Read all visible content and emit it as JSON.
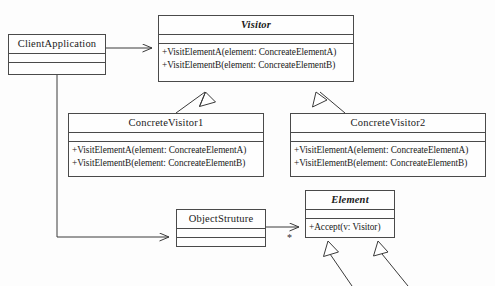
{
  "diagram": {
    "line_color": "#4a4a4a",
    "background_color": "#fdfdfd",
    "text_color": "#1a1a1a",
    "classes": [
      {
        "id": "client-application",
        "name": "ClientApplication",
        "abstract": false,
        "attributes": [],
        "operations": []
      },
      {
        "id": "visitor",
        "name": "Visitor",
        "abstract": true,
        "attributes": [],
        "operations": [
          "+VisitElementA(element: ConcreateElementA)",
          "+VisitElementB(element: ConcreateElementB)"
        ]
      },
      {
        "id": "concrete-visitor-1",
        "name": "ConcreteVisitor1",
        "abstract": false,
        "attributes": [],
        "operations": [
          "+VisitElementA(element: ConcreateElementA)",
          "+VisitElementB(element: ConcreateElementB)"
        ]
      },
      {
        "id": "concrete-visitor-2",
        "name": "ConcreteVisitor2",
        "abstract": false,
        "attributes": [],
        "operations": [
          "+VisitElementA(element: ConcreateElementA)",
          "+VisitElementB(element: ConcreateElementB)"
        ]
      },
      {
        "id": "object-struture",
        "name": "ObjectStruture",
        "abstract": false,
        "attributes": [],
        "operations": []
      },
      {
        "id": "element",
        "name": "Element",
        "abstract": true,
        "attributes": [],
        "operations": [
          "+Accept(v: Visitor)"
        ]
      }
    ],
    "labels": {
      "element_multiplicity": "*"
    },
    "relationships": [
      {
        "from": "client-application",
        "to": "visitor",
        "type": "association-directed"
      },
      {
        "from": "client-application",
        "to": "object-struture",
        "type": "association-directed"
      },
      {
        "from": "concrete-visitor-1",
        "to": "visitor",
        "type": "generalization"
      },
      {
        "from": "concrete-visitor-2",
        "to": "visitor",
        "type": "generalization"
      },
      {
        "from": "object-struture",
        "to": "element",
        "type": "association-directed"
      },
      {
        "from": "concrete-element-a",
        "to": "element",
        "type": "generalization"
      },
      {
        "from": "concrete-element-b",
        "to": "element",
        "type": "generalization"
      }
    ]
  }
}
